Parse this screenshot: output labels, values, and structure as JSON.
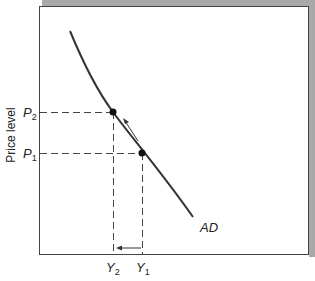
{
  "diagram": {
    "y_axis_label": "Price level",
    "curve_label": "AD",
    "p2": {
      "base": "P",
      "sub": "2"
    },
    "p1": {
      "base": "P",
      "sub": "1"
    },
    "y2": {
      "base": "Y",
      "sub": "2"
    },
    "y1": {
      "base": "Y",
      "sub": "1"
    }
  },
  "colors": {
    "frame_shadow": "#a9a9a9",
    "line": "#333333",
    "background": "#ffffff"
  }
}
